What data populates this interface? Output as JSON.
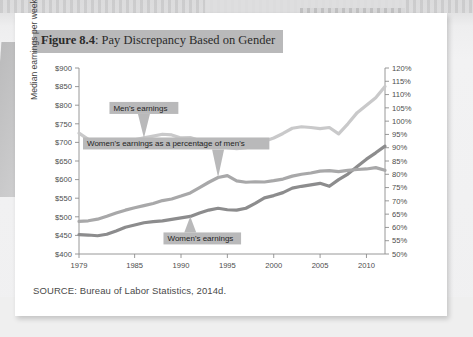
{
  "figure": {
    "number_label": "Figure 8.4",
    "title_separator": ": ",
    "title": "Pay Discrepancy Based on Gender",
    "source": "SOURCE: Bureau of Labor Statistics, 2014d."
  },
  "colors": {
    "mens_line": "#c9c9ca",
    "percent_line": "#a8a8a9",
    "womens_line": "#8c8c8d",
    "axis": "#8d8d8d",
    "annotation_bg": "#b9b9ba",
    "card_bg": "#ffffff",
    "page_bg": "#eeeeef"
  },
  "chart_data": {
    "type": "line",
    "title": "Pay Discrepancy Based on Gender",
    "xlabel": "",
    "ylabel": "Median earnings per week",
    "y2label": "",
    "grid": false,
    "legend_position": "inline-annotations",
    "xlim": [
      1979,
      2012
    ],
    "ylim": [
      400,
      900
    ],
    "y2lim": [
      50,
      120
    ],
    "ytick_labels": [
      "$900",
      "$850",
      "$800",
      "$750",
      "$700",
      "$650",
      "$600",
      "$550",
      "$500",
      "$450",
      "$400"
    ],
    "ytick_values": [
      900,
      850,
      800,
      750,
      700,
      650,
      600,
      550,
      500,
      450,
      400
    ],
    "y2tick_labels": [
      "120%",
      "115%",
      "110%",
      "105%",
      "100%",
      "95%",
      "90%",
      "85%",
      "80%",
      "75%",
      "70%",
      "65%",
      "60%",
      "55%",
      "50%"
    ],
    "y2tick_values": [
      120,
      115,
      110,
      105,
      100,
      95,
      90,
      85,
      80,
      75,
      70,
      65,
      60,
      55,
      50
    ],
    "xtick_labels": [
      "1979",
      "1985",
      "1990",
      "1995",
      "2000",
      "2005",
      "2010"
    ],
    "xtick_values": [
      1979,
      1985,
      1990,
      1995,
      2000,
      2005,
      2010
    ],
    "x": [
      1979,
      1980,
      1981,
      1982,
      1983,
      1984,
      1985,
      1986,
      1987,
      1988,
      1989,
      1990,
      1991,
      1992,
      1993,
      1994,
      1995,
      1996,
      1997,
      1998,
      1999,
      2000,
      2001,
      2002,
      2003,
      2004,
      2005,
      2006,
      2007,
      2008,
      2009,
      2010,
      2011,
      2012
    ],
    "series": [
      {
        "name": "Men's earnings",
        "axis": "left",
        "unit": "$ per week",
        "color": "#c9c9ca",
        "values": [
          725,
          708,
          700,
          698,
          702,
          705,
          707,
          712,
          717,
          722,
          720,
          712,
          713,
          705,
          700,
          693,
          686,
          683,
          686,
          694,
          703,
          712,
          724,
          738,
          742,
          740,
          737,
          740,
          723,
          750,
          780,
          800,
          820,
          850
        ]
      },
      {
        "name": "Women's earnings",
        "axis": "left",
        "unit": "$ per week",
        "color": "#8c8c8d",
        "values": [
          452,
          451,
          449,
          453,
          462,
          472,
          478,
          484,
          487,
          489,
          493,
          497,
          501,
          510,
          518,
          523,
          519,
          518,
          523,
          536,
          551,
          557,
          565,
          577,
          582,
          586,
          590,
          582,
          600,
          615,
          635,
          655,
          672,
          690
        ]
      },
      {
        "name": "Women's earnings as a percentage of men's",
        "axis": "right",
        "unit": "% of men's",
        "color": "#a8a8a9",
        "values": [
          62.3,
          62.5,
          63.1,
          64.2,
          65.4,
          66.5,
          67.4,
          68.2,
          69.0,
          70.1,
          70.7,
          71.8,
          73.0,
          75.0,
          77.0,
          78.8,
          79.5,
          77.5,
          77.0,
          77.2,
          77.1,
          77.6,
          78.2,
          79.3,
          80.0,
          80.5,
          81.2,
          81.4,
          81.0,
          81.5,
          81.8,
          82.0,
          82.5,
          81.5
        ]
      }
    ],
    "annotations": [
      {
        "text": "Men's earnings",
        "target_x": 1986,
        "target_series": "Men's earnings"
      },
      {
        "text": "Women's earnings as a percentage of men's",
        "target_x": 1994,
        "target_series": "Women's earnings as a percentage of men's"
      },
      {
        "text": "Women's earnings",
        "target_x": 1991,
        "target_series": "Women's earnings"
      }
    ]
  }
}
